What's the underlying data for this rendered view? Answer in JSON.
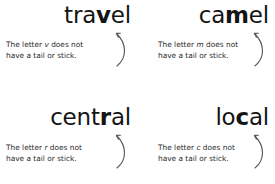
{
  "figure": {
    "background_color": "#ffffff",
    "text_color": "#141414",
    "caption_color": "#2b2b2b",
    "arrow_color": "#555555"
  },
  "panels": [
    {
      "id": "travel",
      "word_before": "tra",
      "word_highlight": "v",
      "word_after": "el",
      "word_full": "travel",
      "highlight_letter": "v",
      "caption_line1_before": "The letter ",
      "caption_line1_letter": "v",
      "caption_line1_after": " does not",
      "caption_line2": "have a tail or stick.",
      "arrow_name": "curved-arrow-up-left"
    },
    {
      "id": "camel",
      "word_before": "ca",
      "word_highlight": "m",
      "word_after": "el",
      "word_full": "camel",
      "highlight_letter": "m",
      "caption_line1_before": "The letter ",
      "caption_line1_letter": "m",
      "caption_line1_after": " does not",
      "caption_line2": "have a tail or stick.",
      "arrow_name": "curved-arrow-up-left"
    },
    {
      "id": "central",
      "word_before": "cent",
      "word_highlight": "r",
      "word_after": "al",
      "word_full": "central",
      "highlight_letter": "r",
      "caption_line1_before": "The letter ",
      "caption_line1_letter": "r",
      "caption_line1_after": " does not",
      "caption_line2": "have a tail or stick.",
      "arrow_name": "curved-arrow-up-left"
    },
    {
      "id": "local",
      "word_before": "lo",
      "word_highlight": "c",
      "word_after": "al",
      "word_full": "local",
      "highlight_letter": "c",
      "caption_line1_before": "The letter ",
      "caption_line1_letter": "c",
      "caption_line1_after": " does not",
      "caption_line2": "have a tail or stick.",
      "arrow_name": "curved-arrow-up-left"
    }
  ]
}
